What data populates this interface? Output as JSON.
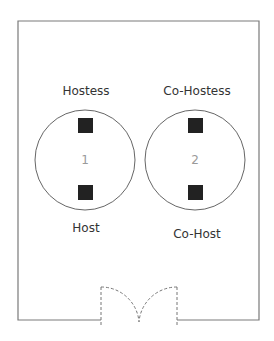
{
  "diagram": {
    "title": "",
    "colors": {
      "wall": "#7a7a7a",
      "table_outline": "#666666",
      "seat": "#222222",
      "door": "#777777",
      "label_text": "#333333",
      "table_number": "#9a9a9a"
    },
    "tables": [
      {
        "number": "1",
        "seats": [
          {
            "label": "Hostess",
            "position": "top"
          },
          {
            "label": "Host",
            "position": "bottom"
          }
        ]
      },
      {
        "number": "2",
        "seats": [
          {
            "label": "Co-Hostess",
            "position": "top"
          },
          {
            "label": "Co-Host",
            "position": "bottom"
          }
        ]
      }
    ],
    "door": {
      "type": "double-swing",
      "location": "bottom-center"
    }
  }
}
